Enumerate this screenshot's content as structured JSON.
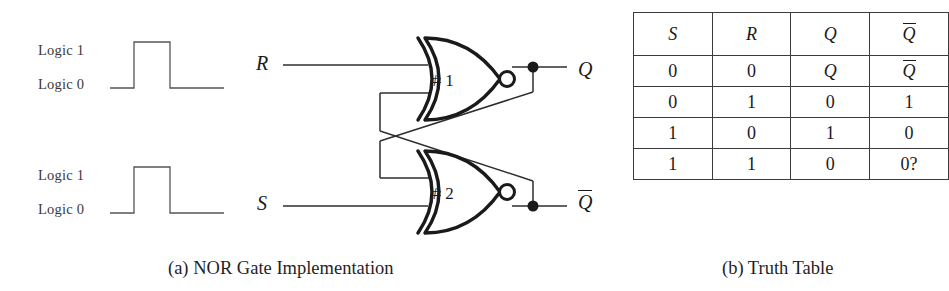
{
  "figure": {
    "panel_a": {
      "caption": "(a) NOR Gate Implementation",
      "waveforms": [
        {
          "name": "r-waveform",
          "high_label": "Logic 1",
          "low_label": "Logic 0"
        },
        {
          "name": "s-waveform",
          "high_label": "Logic 1",
          "low_label": "Logic 0"
        }
      ],
      "circuit": {
        "inputs": [
          {
            "id": "r",
            "label": "R"
          },
          {
            "id": "s",
            "label": "S"
          }
        ],
        "gates": [
          {
            "id": "gate1",
            "label": "# 1",
            "type": "NOR"
          },
          {
            "id": "gate2",
            "label": "# 2",
            "type": "NOR"
          }
        ],
        "outputs": [
          {
            "id": "q",
            "label": "Q",
            "overbar": false
          },
          {
            "id": "qbar",
            "label": "Q",
            "overbar": true
          }
        ]
      }
    },
    "panel_b": {
      "caption": "(b) Truth Table",
      "table": {
        "headers": [
          {
            "text": "S",
            "overbar": false
          },
          {
            "text": "R",
            "overbar": false
          },
          {
            "text": "Q",
            "overbar": false
          },
          {
            "text": "Q",
            "overbar": true
          }
        ],
        "rows": [
          [
            {
              "text": "0",
              "overbar": false,
              "italic": false
            },
            {
              "text": "0",
              "overbar": false,
              "italic": false
            },
            {
              "text": "Q",
              "overbar": false,
              "italic": true
            },
            {
              "text": "Q",
              "overbar": true,
              "italic": true
            }
          ],
          [
            {
              "text": "0",
              "overbar": false,
              "italic": false
            },
            {
              "text": "1",
              "overbar": false,
              "italic": false
            },
            {
              "text": "0",
              "overbar": false,
              "italic": false
            },
            {
              "text": "1",
              "overbar": false,
              "italic": false
            }
          ],
          [
            {
              "text": "1",
              "overbar": false,
              "italic": false
            },
            {
              "text": "0",
              "overbar": false,
              "italic": false
            },
            {
              "text": "1",
              "overbar": false,
              "italic": false
            },
            {
              "text": "0",
              "overbar": false,
              "italic": false
            }
          ],
          [
            {
              "text": "1",
              "overbar": false,
              "italic": false
            },
            {
              "text": "1",
              "overbar": false,
              "italic": false
            },
            {
              "text": "0",
              "overbar": false,
              "italic": false
            },
            {
              "text": "0?",
              "overbar": false,
              "italic": false
            }
          ]
        ]
      }
    }
  },
  "colors": {
    "ink": "#1a1a1a",
    "wire": "#2e2e2e",
    "rule": "#3b3b3b",
    "background": "#ffffff"
  }
}
